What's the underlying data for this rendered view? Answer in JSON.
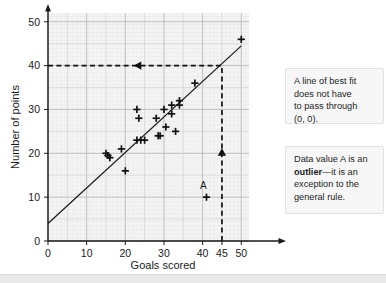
{
  "chart_data": {
    "type": "scatter",
    "title": "",
    "xlabel": "Goals scored",
    "ylabel": "Number of points",
    "xlim": [
      0,
      52
    ],
    "ylim": [
      0,
      52
    ],
    "xticks": [
      0,
      10,
      20,
      30,
      40,
      45,
      50
    ],
    "xtick_labels": [
      "0",
      "10",
      "20",
      "30",
      "40",
      "45",
      "50"
    ],
    "yticks": [
      0,
      10,
      20,
      30,
      40,
      50
    ],
    "ytick_labels": [
      "0",
      "10",
      "20",
      "30",
      "40",
      "50"
    ],
    "grid": true,
    "minor_grid": true,
    "legend": "none",
    "marker": "plus",
    "points": [
      {
        "x": 15,
        "y": 20
      },
      {
        "x": 15.5,
        "y": 19.5
      },
      {
        "x": 16,
        "y": 19
      },
      {
        "x": 19,
        "y": 21
      },
      {
        "x": 20,
        "y": 16
      },
      {
        "x": 23,
        "y": 30
      },
      {
        "x": 23,
        "y": 23
      },
      {
        "x": 23.5,
        "y": 28
      },
      {
        "x": 24,
        "y": 23
      },
      {
        "x": 25,
        "y": 23
      },
      {
        "x": 28,
        "y": 28
      },
      {
        "x": 28.5,
        "y": 24
      },
      {
        "x": 29,
        "y": 24
      },
      {
        "x": 30,
        "y": 30
      },
      {
        "x": 30.5,
        "y": 26
      },
      {
        "x": 32,
        "y": 31
      },
      {
        "x": 32,
        "y": 29
      },
      {
        "x": 33,
        "y": 25
      },
      {
        "x": 34,
        "y": 32
      },
      {
        "x": 34,
        "y": 31
      },
      {
        "x": 38,
        "y": 36
      },
      {
        "x": 41,
        "y": 10
      },
      {
        "x": 50,
        "y": 46
      }
    ],
    "annotations": [
      {
        "name": "outlier-label",
        "text": "A",
        "x": 40.2,
        "y": 11.8
      }
    ],
    "best_fit_line": {
      "name": "line-of-best-fit",
      "x0": 0,
      "y0": 4,
      "x1": 50,
      "y1": 44.5
    },
    "guide_lines": [
      {
        "name": "horizontal-guide-40",
        "orientation": "horizontal",
        "value": 40,
        "from_x": 0,
        "to_x": 45,
        "style": "dashed",
        "arrow": "left",
        "arrow_x": 23.5
      },
      {
        "name": "vertical-guide-45",
        "orientation": "vertical",
        "value": 45,
        "from_y": 0,
        "to_y": 40,
        "style": "dashed",
        "arrow": "up",
        "arrow_y": 20
      }
    ]
  },
  "callouts": {
    "best_fit": {
      "line1": "A line of best fit",
      "line2": "does not have",
      "line3": "to pass through",
      "line4": "(0, 0)."
    },
    "outlier": {
      "line1": "Data value A is an",
      "line2_bold": "outlier",
      "line2_rest": "—it is an",
      "line3": "exception to the",
      "line4": "general rule."
    }
  }
}
